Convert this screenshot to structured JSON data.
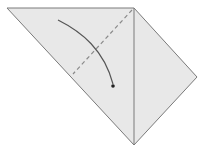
{
  "diagram": {
    "type": "origami-fold-step",
    "colors": {
      "background": "#ffffff",
      "paper_fill": "#e8e8e8",
      "edge_stroke": "#7a7a7a",
      "crease_stroke": "#8a8a8a",
      "arrow_stroke": "#555555"
    },
    "paper": {
      "points": "7,8 134,8 197,77 134,145"
    },
    "center_crease": {
      "x1": 134,
      "y1": 8,
      "x2": 134,
      "y2": 145
    },
    "valley_fold_line": {
      "x1": 132,
      "y1": 10,
      "x2": 73,
      "y2": 74,
      "dash": "4,3"
    },
    "fold_arrow": {
      "path": "M58,20 C82,32 104,50 113,84",
      "head_x": 113,
      "head_y": 86
    }
  }
}
